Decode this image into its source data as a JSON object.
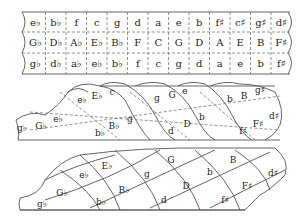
{
  "strip": {
    "rows": [
      [
        "e♭",
        "b♭",
        "f",
        "c",
        "g",
        "d",
        "a",
        "e",
        "b",
        "f♯",
        "c♯",
        "g♯",
        "d♯"
      ],
      [
        "G♭",
        "D♭",
        "A♭",
        "E♭",
        "B♭",
        "F",
        "C",
        "G",
        "D",
        "A",
        "E",
        "B",
        "F♯"
      ],
      [
        "g♭",
        "d♭",
        "a♭",
        "e♭",
        "b♭",
        "f",
        "c",
        "g",
        "d",
        "a",
        "e",
        "b",
        "f♯"
      ]
    ]
  },
  "coil": {
    "labels": [
      {
        "t": "g♭",
        "x": 22,
        "y": 131
      },
      {
        "t": "G♭",
        "x": 41,
        "y": 129
      },
      {
        "t": "e♭",
        "x": 58,
        "y": 122
      },
      {
        "t": "e♭",
        "x": 82,
        "y": 103
      },
      {
        "t": "E♭",
        "x": 97,
        "y": 99
      },
      {
        "t": "c",
        "x": 112,
        "y": 95
      },
      {
        "t": "b♭",
        "x": 100,
        "y": 136
      },
      {
        "t": "B♭",
        "x": 114,
        "y": 129
      },
      {
        "t": "g",
        "x": 130,
        "y": 122
      },
      {
        "t": "g",
        "x": 157,
        "y": 101
      },
      {
        "t": "G",
        "x": 172,
        "y": 98
      },
      {
        "t": "e",
        "x": 185,
        "y": 94
      },
      {
        "t": "d",
        "x": 171,
        "y": 134
      },
      {
        "t": "D",
        "x": 187,
        "y": 127
      },
      {
        "t": "b",
        "x": 202,
        "y": 120
      },
      {
        "t": "b",
        "x": 230,
        "y": 102
      },
      {
        "t": "B",
        "x": 244,
        "y": 99
      },
      {
        "t": "g♯",
        "x": 260,
        "y": 93
      },
      {
        "t": "f♯",
        "x": 243,
        "y": 134
      },
      {
        "t": "F♯",
        "x": 258,
        "y": 127
      },
      {
        "t": "d♯",
        "x": 274,
        "y": 119
      }
    ]
  },
  "cone": {
    "labels": [
      {
        "t": "g♭",
        "x": 42,
        "y": 207
      },
      {
        "t": "G♭",
        "x": 62,
        "y": 196
      },
      {
        "t": "e♭",
        "x": 84,
        "y": 178
      },
      {
        "t": "E♭",
        "x": 107,
        "y": 169
      },
      {
        "t": "b♭",
        "x": 101,
        "y": 205
      },
      {
        "t": "B♭",
        "x": 124,
        "y": 193
      },
      {
        "t": "g",
        "x": 147,
        "y": 177
      },
      {
        "t": "G",
        "x": 171,
        "y": 163
      },
      {
        "t": "d",
        "x": 164,
        "y": 203
      },
      {
        "t": "D",
        "x": 186,
        "y": 189
      },
      {
        "t": "b",
        "x": 210,
        "y": 175
      },
      {
        "t": "B",
        "x": 233,
        "y": 163
      },
      {
        "t": "f♯",
        "x": 225,
        "y": 203
      },
      {
        "t": "F♯",
        "x": 247,
        "y": 189
      },
      {
        "t": "d♯",
        "x": 273,
        "y": 176
      }
    ]
  }
}
